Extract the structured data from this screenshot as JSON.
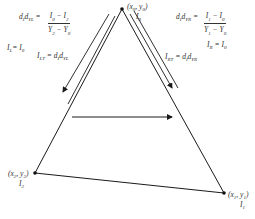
{
  "diagram": {
    "type": "triangle-scanline-gouraud",
    "vertices": {
      "top": {
        "coord_label": "(x0, y0)",
        "intensity_label": "I0"
      },
      "right": {
        "coord_label": "(x1, y1)",
        "intensity_label": "I1"
      },
      "left": {
        "coord_label": "(x2, y2)",
        "intensity_label": "I2"
      }
    },
    "left_edge": {
      "gradient_lhs": "dIdYL =",
      "gradient_numerator": "I0 − I2",
      "gradient_denominator": "Y2 − Y0",
      "init": "IL = I0",
      "step": "ILT = dIdYL"
    },
    "right_edge": {
      "gradient_lhs": "dIdYR =",
      "gradient_numerator": "I1 − I0",
      "gradient_denominator": "Y1 − Y0",
      "init": "IR = I0",
      "step": "IRT = dIdYR"
    },
    "scan_direction": "left-to-right"
  },
  "colors": {
    "line": "#1a1a1a",
    "text": "#333333",
    "background": "#ffffff"
  }
}
